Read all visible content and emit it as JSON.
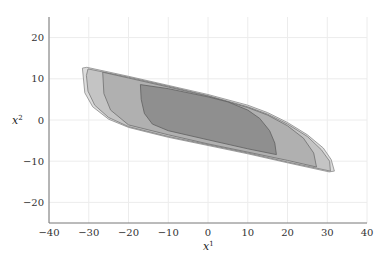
{
  "chart_data": {
    "type": "area",
    "title": "",
    "xlabel": "x",
    "xlabel_sup": "1",
    "ylabel": "x",
    "ylabel_sup": "2",
    "xlim": [
      -40,
      40
    ],
    "ylim": [
      -25,
      25
    ],
    "xticks": [
      -40,
      -30,
      -20,
      -10,
      0,
      10,
      20,
      30,
      40
    ],
    "yticks": [
      -20,
      -10,
      0,
      10,
      20
    ],
    "xtick_labels": [
      "−40",
      "−30",
      "−20",
      "−10",
      "0",
      "10",
      "20",
      "30",
      "40"
    ],
    "ytick_labels": [
      "−20",
      "−10",
      "0",
      "10",
      "20"
    ],
    "grid": true,
    "legend": null,
    "series": [
      {
        "name": "region-outer",
        "fill": "#dcdcdc",
        "stroke": "#8a8a8a",
        "points": [
          [
            -31.6,
            12.6
          ],
          [
            -30.5,
            12.8
          ],
          [
            -20,
            10.6
          ],
          [
            -10,
            8.4
          ],
          [
            0,
            6.2
          ],
          [
            10,
            3.6
          ],
          [
            15,
            1.8
          ],
          [
            20,
            -0.6
          ],
          [
            25,
            -3.6
          ],
          [
            29,
            -6.8
          ],
          [
            31,
            -9.6
          ],
          [
            31.8,
            -12.4
          ],
          [
            30.5,
            -12.6
          ],
          [
            20,
            -10.4
          ],
          [
            10,
            -8.2
          ],
          [
            0,
            -6.2
          ],
          [
            -10,
            -4.2
          ],
          [
            -15,
            -3.0
          ],
          [
            -20,
            -1.8
          ],
          [
            -25,
            0.2
          ],
          [
            -29,
            3.2
          ],
          [
            -31,
            6.6
          ],
          [
            -31.6,
            12.6
          ]
        ]
      },
      {
        "name": "region-middle",
        "fill": "#c4c4c4",
        "stroke": "#7a7a7a",
        "points": [
          [
            -30.2,
            12.4
          ],
          [
            -20,
            10.4
          ],
          [
            -10,
            8.2
          ],
          [
            0,
            5.9
          ],
          [
            10,
            3.2
          ],
          [
            15,
            1.4
          ],
          [
            20,
            -1.0
          ],
          [
            25,
            -4.0
          ],
          [
            28.5,
            -7.2
          ],
          [
            30.6,
            -10.0
          ],
          [
            30.8,
            -12.4
          ],
          [
            20,
            -10.2
          ],
          [
            10,
            -8.0
          ],
          [
            0,
            -6.0
          ],
          [
            -10,
            -4.0
          ],
          [
            -20,
            -1.6
          ],
          [
            -25,
            0.6
          ],
          [
            -28.5,
            3.6
          ],
          [
            -30.2,
            7.0
          ],
          [
            -30.6,
            10.8
          ],
          [
            -30.2,
            12.4
          ]
        ]
      },
      {
        "name": "region-inner",
        "fill": "#b0b0b0",
        "stroke": "#6e6e6e",
        "points": [
          [
            -26.5,
            11.6
          ],
          [
            -20,
            10.2
          ],
          [
            -10,
            8.0
          ],
          [
            0,
            5.8
          ],
          [
            10,
            3.0
          ],
          [
            15,
            1.2
          ],
          [
            20,
            -1.4
          ],
          [
            24,
            -4.4
          ],
          [
            26.6,
            -8.0
          ],
          [
            27.3,
            -11.4
          ],
          [
            20,
            -9.8
          ],
          [
            10,
            -7.8
          ],
          [
            0,
            -5.8
          ],
          [
            -10,
            -3.6
          ],
          [
            -20,
            -1.2
          ],
          [
            -24.5,
            2.4
          ],
          [
            -26.2,
            6.4
          ],
          [
            -26.5,
            11.6
          ]
        ]
      },
      {
        "name": "region-core",
        "fill": "#8f8f8f",
        "stroke": "#5f5f5f",
        "points": [
          [
            -17,
            8.6
          ],
          [
            -10,
            7.6
          ],
          [
            0,
            5.6
          ],
          [
            5,
            4.4
          ],
          [
            10,
            2.4
          ],
          [
            13,
            0.4
          ],
          [
            15.5,
            -2.6
          ],
          [
            16.8,
            -5.6
          ],
          [
            17.2,
            -8.4
          ],
          [
            10,
            -7.0
          ],
          [
            0,
            -4.8
          ],
          [
            -10,
            -2.6
          ],
          [
            -14,
            -1.0
          ],
          [
            -16,
            1.6
          ],
          [
            -16.8,
            5.0
          ],
          [
            -17,
            8.6
          ]
        ]
      }
    ]
  }
}
